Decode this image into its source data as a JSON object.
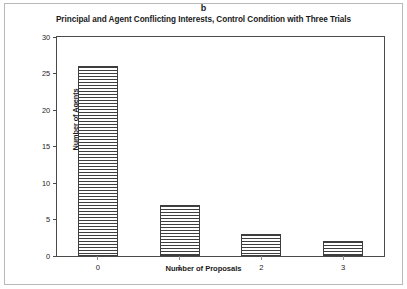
{
  "figure": {
    "panel_label": "b",
    "background_color": "#ffffff",
    "border_color": "#b9b9b9",
    "axis_color": "#4a4a4a",
    "bar_edge_color": "#3d3d3d",
    "bar_hatch_color": "#3f3f3f"
  },
  "chart_data": {
    "type": "bar",
    "title": "Principal and Agent Conflicting Interests, Control Condition with Three Trials",
    "xlabel": "Number of Proposals",
    "ylabel": "Number of Agents",
    "categories": [
      "0",
      "1",
      "2",
      "3"
    ],
    "values": [
      26,
      7,
      3,
      2
    ],
    "ylim": [
      0,
      30
    ],
    "yticks": [
      0,
      5,
      10,
      15,
      20,
      25,
      30
    ],
    "ytick_labels": [
      "0",
      "5",
      "10",
      "15",
      "20",
      "25",
      "30"
    ],
    "grid": false,
    "legend": false,
    "bar_style": "horizontal-hatch"
  }
}
